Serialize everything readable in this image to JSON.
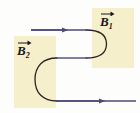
{
  "figure": {
    "type": "physics-diagram",
    "background_color": "#fdfdfb",
    "regions": [
      {
        "id": "b1",
        "label_symbol": "B",
        "label_subscript": "1",
        "vector_arrow": true,
        "fill_color": "#f6efcb",
        "x": 92,
        "y": 8,
        "width": 42,
        "height": 60
      },
      {
        "id": "b2",
        "label_symbol": "B",
        "label_subscript": "2",
        "vector_arrow": true,
        "fill_color": "#f6efcb",
        "x": 14,
        "y": 36,
        "width": 42,
        "height": 72
      }
    ],
    "trajectory": {
      "stroke_color": "#2a2520",
      "stroke_width": 1.3,
      "path": "M 31 30 L 88 30 C 101 30 106 36 106 44 C 106 52 101 58 88 58 L 55 58 C 42 58 35 66 35 79.5 C 35 93 42 101 55 101 L 136 101"
    },
    "arrow_segments": [
      {
        "id": "top-incoming",
        "stroke_color": "#4b4a76",
        "x1": 31,
        "y1": 30,
        "x2": 88,
        "y2": 30,
        "arrowhead_x": 64,
        "direction": "right"
      },
      {
        "id": "middle-return",
        "stroke_color": "#4b4a76",
        "x1": 55,
        "y1": 58,
        "x2": 88,
        "y2": 58,
        "arrowhead_x": null,
        "direction": "left"
      },
      {
        "id": "bottom-outgoing",
        "stroke_color": "#4b4a76",
        "x1": 55,
        "y1": 101,
        "x2": 136,
        "y2": 101,
        "arrowhead_x": 101,
        "direction": "right"
      }
    ]
  },
  "labels": {
    "b1": {
      "symbol": "B",
      "subscript": "1"
    },
    "b2": {
      "symbol": "B",
      "subscript": "2"
    }
  }
}
